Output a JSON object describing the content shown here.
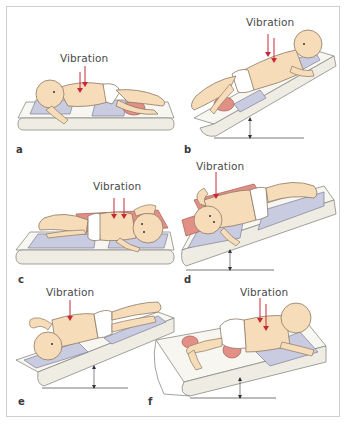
{
  "figure": {
    "annotation_label": "Vibration",
    "colors": {
      "border": "#cfcfcf",
      "mattress": "#f1efe6",
      "mattress_edge": "#8a8a85",
      "pillow": "#c9cbe0",
      "skin": "#f6dcb8",
      "skin_outline": "#8c7a64",
      "wedge": "#e29086",
      "arrow": "#c8283a",
      "diaper": "#ffffff"
    },
    "panels": [
      {
        "id": "a",
        "letter": "a",
        "label": "Vibration",
        "surface": "flat",
        "position": "supine, side-lying on back"
      },
      {
        "id": "b",
        "letter": "b",
        "label": "Vibration",
        "surface": "inclined, head up",
        "position": "supine"
      },
      {
        "id": "c",
        "letter": "c",
        "label": "Vibration",
        "surface": "flat",
        "position": "side-lying"
      },
      {
        "id": "d",
        "letter": "d",
        "label": "Vibration",
        "surface": "inclined",
        "position": "side-lying"
      },
      {
        "id": "e",
        "letter": "e",
        "label": "Vibration",
        "surface": "inclined, head down",
        "position": "prone/side"
      },
      {
        "id": "f",
        "letter": "f",
        "label": "Vibration",
        "surface": "inclined",
        "position": "prone"
      }
    ]
  }
}
